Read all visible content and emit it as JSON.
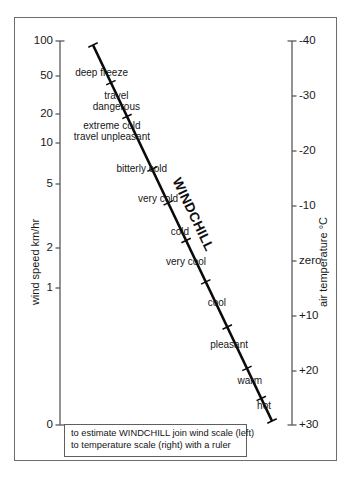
{
  "figure": {
    "caption_lines": [
      "to estimate WINDCHILL join wind scale (left)",
      "to temperature scale (right) with a ruler"
    ],
    "diagonal_label": "WINDCHILL"
  },
  "chart_data": {
    "type": "line",
    "subtitle": "",
    "annotations": [
      "WINDCHILL",
      "to estimate WINDCHILL join wind scale (left)",
      "to temperature scale (right) with a ruler"
    ],
    "grid": false,
    "legend": "none",
    "left_axis": {
      "label": "wind speed km/hr",
      "scale": "log-like nomogram",
      "ticks": [
        {
          "label": "100",
          "value": 100,
          "y": 41
        },
        {
          "label": "50",
          "value": 50,
          "y": 76
        },
        {
          "label": "20",
          "value": 20,
          "y": 114
        },
        {
          "label": "10",
          "value": 10,
          "y": 143
        },
        {
          "label": "5",
          "value": 5,
          "y": 184
        },
        {
          "label": "2",
          "value": 2,
          "y": 248
        },
        {
          "label": "1",
          "value": 1,
          "y": 288
        },
        {
          "label": "0",
          "value": 0,
          "y": 425
        }
      ],
      "axis_x": 60,
      "axis_y_top": 41,
      "axis_y_bottom": 425
    },
    "right_axis": {
      "label": "air temperature °C",
      "scale": "linear",
      "ticks": [
        {
          "label": "-40",
          "value": -40,
          "y": 41
        },
        {
          "label": "-30",
          "value": -30,
          "y": 96
        },
        {
          "label": "-20",
          "value": -20,
          "y": 151
        },
        {
          "label": "-10",
          "value": -10,
          "y": 206
        },
        {
          "label": "zero",
          "value": 0,
          "y": 261
        },
        {
          "label": "+10",
          "value": 10,
          "y": 316
        },
        {
          "label": "+20",
          "value": 20,
          "y": 371
        },
        {
          "label": "+30",
          "value": 30,
          "y": 425
        }
      ],
      "axis_x": 292,
      "axis_y_top": 41,
      "axis_y_bottom": 425
    },
    "windchill_line": {
      "x1": 93,
      "y1": 45,
      "x2": 272,
      "y2": 421,
      "tick_positions_t": [
        0.0,
        0.1,
        0.19,
        0.33,
        0.42,
        0.52,
        0.63,
        0.75,
        0.86,
        0.94,
        1.0
      ]
    },
    "bands": [
      {
        "label": "deep freeze",
        "lines": [
          "deep freeze"
        ],
        "x": 128,
        "y": 73
      },
      {
        "label": "travel dangerous",
        "lines": [
          "travel",
          "dangerous"
        ],
        "x": 140,
        "y": 101
      },
      {
        "label": "extreme cold travel unpleasant",
        "lines": [
          "extreme cold",
          "travel unpleasant"
        ],
        "x": 150,
        "y": 131
      },
      {
        "label": "bitterly cold",
        "lines": [
          "bitterly cold"
        ],
        "x": 167,
        "y": 169
      },
      {
        "label": "very cold",
        "lines": [
          "very cold"
        ],
        "x": 178,
        "y": 199
      },
      {
        "label": "cold",
        "lines": [
          "cold"
        ],
        "x": 189,
        "y": 232
      },
      {
        "label": "very cool",
        "lines": [
          "very cool"
        ],
        "x": 206,
        "y": 262
      },
      {
        "label": "cool",
        "lines": [
          "cool"
        ],
        "x": 226,
        "y": 303
      },
      {
        "label": "pleasant",
        "lines": [
          "pleasant"
        ],
        "x": 248,
        "y": 345
      },
      {
        "label": "warm",
        "lines": [
          "warm"
        ],
        "x": 262,
        "y": 381
      },
      {
        "label": "hot",
        "lines": [
          "hot"
        ],
        "x": 271,
        "y": 406
      }
    ]
  },
  "colors": {
    "ink": "#111111",
    "frame": "#6d6d6d",
    "axis": "#5a5a5a",
    "line": "#0a0a0a",
    "background": "#ffffff"
  }
}
